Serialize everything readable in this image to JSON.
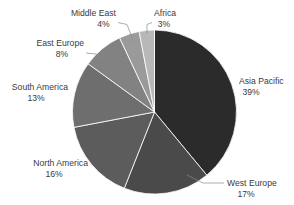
{
  "chart_data": {
    "type": "pie",
    "title": "",
    "subtitle": "",
    "xlabel": "",
    "ylabel": "",
    "legend_position": "none",
    "grid": false,
    "value_unit": "%",
    "start_angle_deg": 0,
    "direction": "clockwise",
    "categories": [
      "Asia Pacific",
      "West Europe",
      "North America",
      "South America",
      "East Europe",
      "Middle East",
      "Africa"
    ],
    "values": [
      39,
      17,
      16,
      13,
      8,
      4,
      3
    ],
    "labels": [
      "39%",
      "17%",
      "16%",
      "13%",
      "8%",
      "4%",
      "3%"
    ],
    "colors": [
      "#2b2b2b",
      "#4a4a4a",
      "#5c5c5c",
      "#6e6e6e",
      "#828282",
      "#9a9a9a",
      "#b8b8b8"
    ],
    "slices": [
      {
        "name": "Asia Pacific",
        "value": 39,
        "label": "39%",
        "color": "#2b2b2b"
      },
      {
        "name": "West Europe",
        "value": 17,
        "label": "17%",
        "color": "#4a4a4a"
      },
      {
        "name": "North America",
        "value": 16,
        "label": "16%",
        "color": "#5c5c5c"
      },
      {
        "name": "South America",
        "value": 13,
        "label": "13%",
        "color": "#6e6e6e"
      },
      {
        "name": "East Europe",
        "value": 8,
        "label": "8%",
        "color": "#828282"
      },
      {
        "name": "Middle East",
        "value": 4,
        "label": "4%",
        "color": "#9a9a9a"
      },
      {
        "name": "Africa",
        "value": 3,
        "label": "3%",
        "color": "#b8b8b8"
      }
    ]
  },
  "annotations": {
    "asia_pacific": {
      "name": "Asia Pacific",
      "pct": "39%"
    },
    "west_europe": {
      "name": "West Europe",
      "pct": "17%"
    },
    "north_america": {
      "name": "North America",
      "pct": "16%"
    },
    "south_america": {
      "name": "South America",
      "pct": "13%"
    },
    "east_europe": {
      "name": "East Europe",
      "pct": "8%"
    },
    "middle_east": {
      "name": "Middle East",
      "pct": "4%"
    },
    "africa": {
      "name": "Africa",
      "pct": "3%"
    }
  }
}
